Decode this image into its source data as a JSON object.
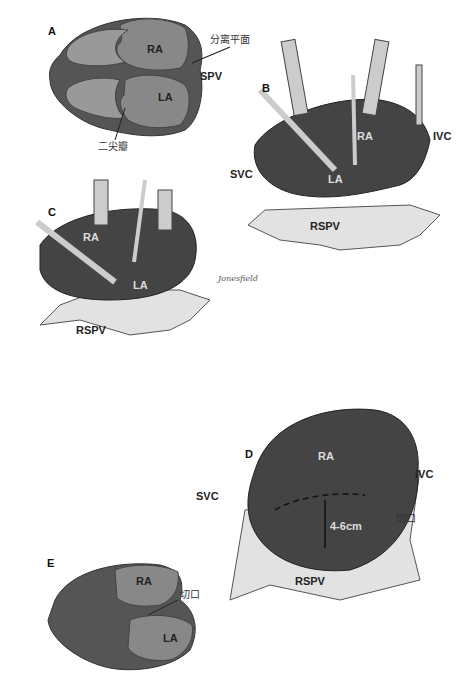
{
  "figure": {
    "panels": [
      {
        "id": "A",
        "labels": {
          "ra": "RA",
          "la": "LA",
          "spv": "SPV",
          "plane": "分离平面",
          "mitral": "二尖瓣"
        }
      },
      {
        "id": "B",
        "labels": {
          "ra": "RA",
          "la": "LA",
          "svc": "SVC",
          "ivc": "IVC",
          "rspv": "RSPV"
        }
      },
      {
        "id": "C",
        "labels": {
          "ra": "RA",
          "la": "LA",
          "rspv": "RSPV"
        }
      },
      {
        "id": "D",
        "labels": {
          "ra": "RA",
          "svc": "SVC",
          "ivc": "IVC",
          "rspv": "RSPV",
          "measure": "4-6cm",
          "incision": "切口"
        }
      },
      {
        "id": "E",
        "labels": {
          "ra": "RA",
          "la": "LA",
          "incision": "切口"
        }
      }
    ],
    "signature": "Jonesfield"
  }
}
